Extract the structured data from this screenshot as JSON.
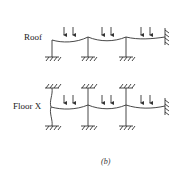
{
  "diagram": {
    "labels": {
      "roof": "Roof",
      "floor": "Floor X",
      "caption": "(b)"
    },
    "colors": {
      "line": "#333333",
      "background": "#ffffff"
    },
    "frames": [
      {
        "name": "roof",
        "beam_y": 38,
        "columns_x": [
          52,
          88,
          126
        ],
        "columns_below": true,
        "columns_above": false,
        "fixed_right_wall_x": 165,
        "load_arrow_pairs_x": [
          [
            64,
            73
          ],
          [
            102,
            111
          ],
          [
            141,
            150
          ]
        ]
      },
      {
        "name": "floor-x",
        "beam_y": 107,
        "columns_x": [
          52,
          88,
          126
        ],
        "columns_below": true,
        "columns_above": true,
        "fixed_right_wall_x": 165,
        "load_arrow_pairs_x": [
          [
            64,
            73
          ],
          [
            102,
            111
          ],
          [
            141,
            150
          ]
        ]
      }
    ]
  }
}
